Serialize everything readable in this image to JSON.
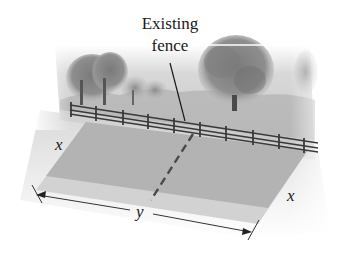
{
  "diagram": {
    "type": "illustration",
    "callout": {
      "line1": "Existing",
      "line2": "fence"
    },
    "labels": {
      "left_side": "x",
      "right_side": "x",
      "bottom_length": "y"
    },
    "elements": [
      {
        "name": "existing-fence",
        "kind": "rail fence along top edge of field"
      },
      {
        "name": "field",
        "kind": "shaded parallelogram (rectangle in perspective)"
      },
      {
        "name": "divider",
        "kind": "dashed line splitting field into two parts"
      },
      {
        "name": "dimension-y",
        "kind": "double-headed arrow along front edge"
      },
      {
        "name": "background-trees",
        "kind": "landscape scenery behind fence"
      }
    ]
  },
  "colors": {
    "field": "#b4b4b4",
    "field_front_strip": "#d4d4d4",
    "fence": "#3a3a3a",
    "sky_band": "#d0d0d0",
    "tree_dark": "#6a6a6a",
    "tree_light": "#9a9a9a",
    "ink": "#1a1a1a"
  }
}
